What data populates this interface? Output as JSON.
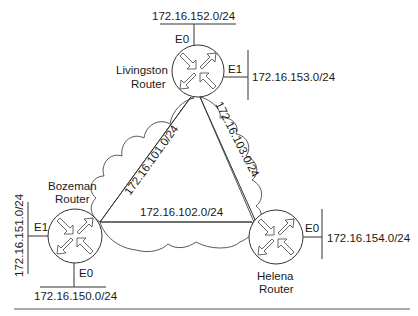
{
  "diagram": {
    "title": "",
    "routers": [
      {
        "id": "livingston",
        "name_line1": "Livingston",
        "name_line2": "Router",
        "cx": 198,
        "cy": 71,
        "r": 26
      },
      {
        "id": "bozeman",
        "name_line1": "Bozeman",
        "name_line2": "Router",
        "cx": 75,
        "cy": 236,
        "r": 27
      },
      {
        "id": "helena",
        "name_line1": "Helena",
        "name_line2": "Router",
        "cx": 276,
        "cy": 237,
        "r": 27
      }
    ],
    "lan_segments": [
      {
        "router": "livingston",
        "interface": "E0",
        "network": "172.16.152.0/24"
      },
      {
        "router": "livingston",
        "interface": "E1",
        "network": "172.16.153.0/24"
      },
      {
        "router": "bozeman",
        "interface": "E1",
        "network": "172.16.151.0/24"
      },
      {
        "router": "bozeman",
        "interface": "E0",
        "network": "172.16.150.0/24"
      },
      {
        "router": "helena",
        "interface": "E0",
        "network": "172.16.154.0/24"
      }
    ],
    "wan_links": [
      {
        "from": "bozeman",
        "to": "livingston",
        "network": "172.16.101.0/24"
      },
      {
        "from": "bozeman",
        "to": "helena",
        "network": "172.16.102.0/24"
      },
      {
        "from": "livingston",
        "to": "helena",
        "network": "172.16.103.0/24"
      }
    ],
    "colors": {
      "line": "#333333",
      "background": "#ffffff",
      "text": "#1a1a1a"
    }
  }
}
